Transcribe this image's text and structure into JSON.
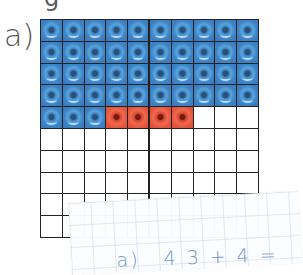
{
  "exercise": {
    "top_fragment": "g",
    "label": "a)",
    "grid": {
      "rows": 10,
      "cols": 10,
      "blue_count": 43,
      "red_count": 4,
      "blue_color": "#3b7dbf",
      "red_color": "#e2503a",
      "row_fill": [
        [
          "blue",
          "blue",
          "blue",
          "blue",
          "blue",
          "blue",
          "blue",
          "blue",
          "blue",
          "blue"
        ],
        [
          "blue",
          "blue",
          "blue",
          "blue",
          "blue",
          "blue",
          "blue",
          "blue",
          "blue",
          "blue"
        ],
        [
          "blue",
          "blue",
          "blue",
          "blue",
          "blue",
          "blue",
          "blue",
          "blue",
          "blue",
          "blue"
        ],
        [
          "blue",
          "blue",
          "blue",
          "blue",
          "blue",
          "blue",
          "blue",
          "blue",
          "blue",
          "blue"
        ],
        [
          "blue",
          "blue",
          "blue",
          "red",
          "red",
          "red",
          "red",
          "empty",
          "empty",
          "empty"
        ]
      ]
    }
  },
  "note": {
    "label": "a)",
    "tokens": [
      "4",
      "3",
      "+",
      "4",
      "="
    ],
    "text_color": "#6d95c9"
  }
}
